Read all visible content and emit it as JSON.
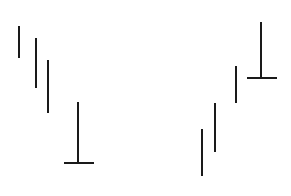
{
  "canvas": {
    "width": 291,
    "height": 196,
    "background_color": "#ffffff",
    "description": "Abstract line drawing of eight dark vertical strokes on a white field, two of which are up-tack (perpendicular) glyphs."
  },
  "style": {
    "stroke_color": "#1a1a1a",
    "stroke_width": 2,
    "stroke_linecap": "butt"
  },
  "figure": {
    "title": "",
    "stroke_count": 8,
    "glyph_counts": {
      "vertical_bar": 6,
      "up_tack": 2
    },
    "groups": [
      {
        "name": "left-cluster",
        "label": "left descending group",
        "strokes": [
          {
            "id": "left-bar-1",
            "glyph": "vertical-bar",
            "x": 19,
            "y1": 26,
            "y2": 58,
            "length": 32
          },
          {
            "id": "left-bar-2",
            "glyph": "vertical-bar",
            "x": 36,
            "y1": 38,
            "y2": 88,
            "length": 50
          },
          {
            "id": "left-bar-3",
            "glyph": "vertical-bar",
            "x": 48,
            "y1": 60,
            "y2": 113,
            "length": 53
          },
          {
            "id": "left-up-tack",
            "glyph": "up-tack",
            "x": 78,
            "y1": 102,
            "y2": 163,
            "length": 61,
            "base_y": 163,
            "base_x1": 64,
            "base_x2": 94,
            "base_width": 30
          }
        ]
      },
      {
        "name": "right-cluster",
        "label": "right ascending group",
        "strokes": [
          {
            "id": "right-bar-1",
            "glyph": "vertical-bar",
            "x": 202,
            "y1": 129,
            "y2": 176,
            "length": 47
          },
          {
            "id": "right-bar-2",
            "glyph": "vertical-bar",
            "x": 215,
            "y1": 103,
            "y2": 152,
            "length": 49
          },
          {
            "id": "right-bar-3",
            "glyph": "vertical-bar",
            "x": 236,
            "y1": 66,
            "y2": 103,
            "length": 37
          },
          {
            "id": "right-up-tack",
            "glyph": "up-tack",
            "x": 261,
            "y1": 22,
            "y2": 78,
            "length": 56,
            "base_y": 78,
            "base_x1": 247,
            "base_x2": 277,
            "base_width": 30
          }
        ]
      }
    ]
  }
}
